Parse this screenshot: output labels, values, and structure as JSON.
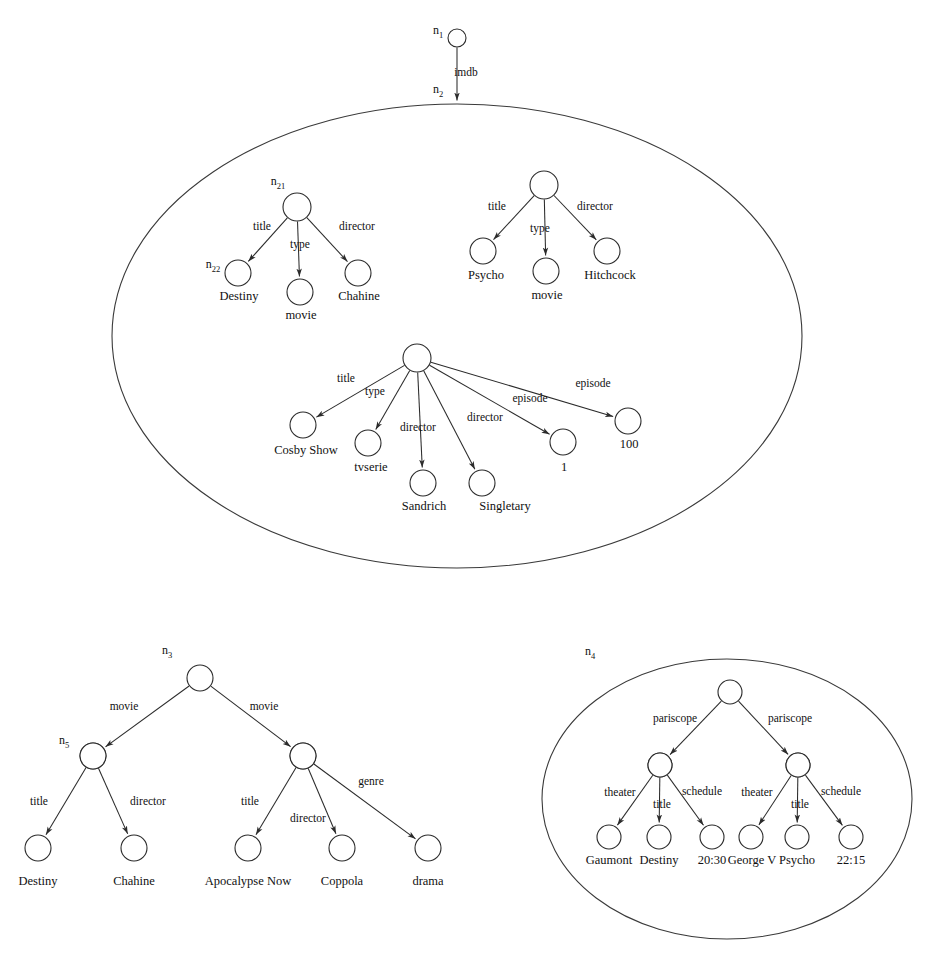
{
  "figure": {
    "background_color": "#ffffff",
    "stroke_color": "#2b2b2b"
  },
  "nodes": {
    "n1": {
      "id_label": "n",
      "id_sub": "1",
      "cx": 457,
      "cy": 38,
      "r": 9
    },
    "n2": {
      "id_label": "n",
      "id_sub": "2",
      "cx": 457,
      "cy": 103,
      "r": 0
    },
    "n21": {
      "id_label": "n",
      "id_sub": "21",
      "cx": 297,
      "cy": 207,
      "r": 14
    },
    "n22": {
      "id_label": "n",
      "id_sub": "22",
      "cx": 238,
      "cy": 273,
      "r": 13
    },
    "n3": {
      "id_label": "n",
      "id_sub": "3",
      "cx": 200,
      "cy": 678,
      "r": 13
    },
    "n4": {
      "id_label": "n",
      "id_sub": "4",
      "cx": 730,
      "cy": 692,
      "r": 12
    },
    "n5": {
      "id_label": "n",
      "id_sub": "5",
      "cx": 93,
      "cy": 756,
      "r": 13
    }
  },
  "root_edge": {
    "label": "imdb",
    "x": 466,
    "y": 76
  },
  "regions": [
    {
      "name": "imdb-region",
      "cx": 457,
      "cy": 336,
      "rx": 345,
      "ry": 232
    },
    {
      "name": "pariscope-region",
      "cx": 727,
      "cy": 799,
      "rx": 185,
      "ry": 140
    }
  ],
  "trees": {
    "destiny_tree": {
      "root": {
        "cx": 297,
        "cy": 207,
        "r": 14
      },
      "children": [
        {
          "edge": "title",
          "edge_x": 262,
          "edge_y": 230,
          "cx": 238,
          "cy": 273,
          "r": 13,
          "leaf": "Destiny",
          "leaf_x": 239,
          "leaf_y": 300
        },
        {
          "edge": "type",
          "edge_x": 300,
          "edge_y": 248,
          "cx": 300,
          "cy": 292,
          "r": 13,
          "leaf": "movie",
          "leaf_x": 301,
          "leaf_y": 319
        },
        {
          "edge": "director",
          "edge_x": 357,
          "edge_y": 230,
          "cx": 358,
          "cy": 273,
          "r": 13,
          "leaf": "Chahine",
          "leaf_x": 359,
          "leaf_y": 300
        }
      ]
    },
    "psycho_tree": {
      "root": {
        "cx": 544,
        "cy": 185,
        "r": 14
      },
      "children": [
        {
          "edge": "title",
          "edge_x": 497,
          "edge_y": 210,
          "cx": 483,
          "cy": 251,
          "r": 13,
          "leaf": "Psycho",
          "leaf_x": 486,
          "leaf_y": 279
        },
        {
          "edge": "type",
          "edge_x": 540,
          "edge_y": 232,
          "cx": 546,
          "cy": 271,
          "r": 13,
          "leaf": "movie",
          "leaf_x": 547,
          "leaf_y": 299
        },
        {
          "edge": "director",
          "edge_x": 595,
          "edge_y": 210,
          "cx": 607,
          "cy": 251,
          "r": 13,
          "leaf": "Hitchcock",
          "leaf_x": 610,
          "leaf_y": 279
        }
      ]
    },
    "cosby_tree": {
      "root": {
        "cx": 417,
        "cy": 358,
        "r": 14
      },
      "children": [
        {
          "edge": "title",
          "edge_x": 346,
          "edge_y": 382,
          "cx": 303,
          "cy": 425,
          "r": 13,
          "leaf": "Cosby Show",
          "leaf_x": 306,
          "leaf_y": 454
        },
        {
          "edge": "type",
          "edge_x": 375,
          "edge_y": 395,
          "cx": 368,
          "cy": 443,
          "r": 13,
          "leaf": "tvserie",
          "leaf_x": 371,
          "leaf_y": 471
        },
        {
          "edge": "director",
          "edge_x": 418,
          "edge_y": 431,
          "cx": 423,
          "cy": 483,
          "r": 13,
          "leaf": "Sandrich",
          "leaf_x": 424,
          "leaf_y": 510
        },
        {
          "edge": "director",
          "edge_x": 485,
          "edge_y": 421,
          "cx": 482,
          "cy": 483,
          "r": 13,
          "leaf": "Singletary",
          "leaf_x": 505,
          "leaf_y": 510
        },
        {
          "edge": "episode",
          "edge_x": 530,
          "edge_y": 402,
          "cx": 563,
          "cy": 442,
          "r": 13,
          "leaf": "1",
          "leaf_x": 564,
          "leaf_y": 471
        },
        {
          "edge": "episode",
          "edge_x": 593,
          "edge_y": 387,
          "cx": 628,
          "cy": 421,
          "r": 13,
          "leaf": "100",
          "leaf_x": 629,
          "leaf_y": 448
        }
      ]
    },
    "pariscope_root_tree": {
      "root": {
        "cx": 730,
        "cy": 692,
        "r": 12
      },
      "children": [
        {
          "edge": "pariscope",
          "edge_x": 675,
          "edge_y": 722,
          "cx": 660,
          "cy": 765,
          "r": 12
        },
        {
          "edge": "pariscope",
          "edge_x": 790,
          "edge_y": 722,
          "cx": 798,
          "cy": 765,
          "r": 12
        }
      ]
    },
    "pariscope_left_tree": {
      "root": {
        "cx": 660,
        "cy": 765,
        "r": 12
      },
      "children": [
        {
          "edge": "theater",
          "edge_x": 620,
          "edge_y": 796,
          "cx": 609,
          "cy": 837,
          "r": 12,
          "leaf": "Gaumont",
          "leaf_x": 609,
          "leaf_y": 864
        },
        {
          "edge": "title",
          "edge_x": 662,
          "edge_y": 808,
          "cx": 659,
          "cy": 837,
          "r": 12,
          "leaf": "Destiny",
          "leaf_x": 659,
          "leaf_y": 864
        },
        {
          "edge": "schedule",
          "edge_x": 702,
          "edge_y": 795,
          "cx": 712,
          "cy": 837,
          "r": 12,
          "leaf": "20:30",
          "leaf_x": 712,
          "leaf_y": 864
        }
      ]
    },
    "pariscope_right_tree": {
      "root": {
        "cx": 798,
        "cy": 765,
        "r": 12
      },
      "children": [
        {
          "edge": "theater",
          "edge_x": 757,
          "edge_y": 796,
          "cx": 751,
          "cy": 837,
          "r": 12,
          "leaf": "George V",
          "leaf_x": 752,
          "leaf_y": 864
        },
        {
          "edge": "title",
          "edge_x": 800,
          "edge_y": 808,
          "cx": 797,
          "cy": 837,
          "r": 12,
          "leaf": "Psycho",
          "leaf_x": 797,
          "leaf_y": 864
        },
        {
          "edge": "schedule",
          "edge_x": 841,
          "edge_y": 795,
          "cx": 851,
          "cy": 837,
          "r": 12,
          "leaf": "22:15",
          "leaf_x": 851,
          "leaf_y": 864
        }
      ]
    },
    "n3_tree": {
      "root": {
        "cx": 200,
        "cy": 678,
        "r": 13
      },
      "children": [
        {
          "edge": "movie",
          "edge_x": 124,
          "edge_y": 710,
          "cx": 93,
          "cy": 756,
          "r": 13
        },
        {
          "edge": "movie",
          "edge_x": 264,
          "edge_y": 710,
          "cx": 303,
          "cy": 756,
          "r": 13
        }
      ]
    },
    "n5_tree": {
      "root": {
        "cx": 93,
        "cy": 756,
        "r": 13
      },
      "children": [
        {
          "edge": "title",
          "edge_x": 39,
          "edge_y": 805,
          "cx": 38,
          "cy": 848,
          "r": 13,
          "leaf": "Destiny",
          "leaf_x": 38,
          "leaf_y": 885
        },
        {
          "edge": "director",
          "edge_x": 148,
          "edge_y": 805,
          "cx": 134,
          "cy": 848,
          "r": 13,
          "leaf": "Chahine",
          "leaf_x": 134,
          "leaf_y": 885
        }
      ]
    },
    "apocalypse_tree": {
      "root": {
        "cx": 303,
        "cy": 756,
        "r": 13
      },
      "children": [
        {
          "edge": "title",
          "edge_x": 250,
          "edge_y": 805,
          "cx": 248,
          "cy": 848,
          "r": 13,
          "leaf": "Apocalypse Now",
          "leaf_x": 248,
          "leaf_y": 885
        },
        {
          "edge": "director",
          "edge_x": 308,
          "edge_y": 822,
          "cx": 342,
          "cy": 848,
          "r": 13,
          "leaf": "Coppola",
          "leaf_x": 342,
          "leaf_y": 885
        },
        {
          "edge": "genre",
          "edge_x": 371,
          "edge_y": 785,
          "cx": 428,
          "cy": 848,
          "r": 13,
          "leaf": "drama",
          "leaf_x": 428,
          "leaf_y": 885
        }
      ]
    }
  },
  "node_id_labels": [
    {
      "name": "n1-label",
      "base": "n",
      "sub": "1",
      "x": 438,
      "y": 34
    },
    {
      "name": "n2-label",
      "base": "n",
      "sub": "2",
      "x": 438,
      "y": 93
    },
    {
      "name": "n21-label",
      "base": "n",
      "sub": "21",
      "x": 278,
      "y": 185
    },
    {
      "name": "n22-label",
      "base": "n",
      "sub": "22",
      "x": 213,
      "y": 268
    },
    {
      "name": "n3-label",
      "base": "n",
      "sub": "3",
      "x": 167,
      "y": 654
    },
    {
      "name": "n4-label",
      "base": "n",
      "sub": "4",
      "x": 590,
      "y": 655
    },
    {
      "name": "n5-label",
      "base": "n",
      "sub": "5",
      "x": 64,
      "y": 744
    }
  ]
}
